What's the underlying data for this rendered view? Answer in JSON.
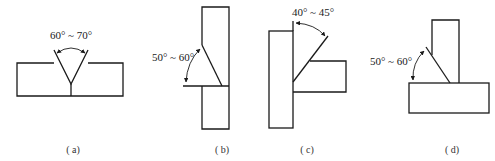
{
  "figures": [
    {
      "id": "a",
      "label": "( a)",
      "angle": "60° ~ 70°",
      "description": "V-groove butt joint"
    },
    {
      "id": "b",
      "label": "( b)",
      "angle": "50° ~ 60°",
      "description": "Single-bevel butt joint"
    },
    {
      "id": "c",
      "label": "( c)",
      "angle": "40° ~ 45°",
      "description": "Single-bevel T-joint (vertical plate)"
    },
    {
      "id": "d",
      "label": "( d)",
      "angle": "50° ~ 60°",
      "description": "Single-bevel T-joint"
    }
  ],
  "colors": {
    "line": "#1a1a1a",
    "background": "#ffffff"
  }
}
